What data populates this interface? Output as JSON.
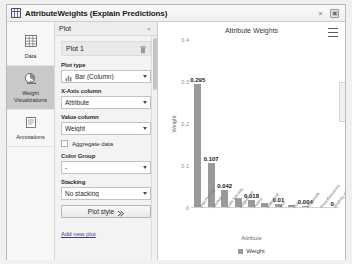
{
  "window": {
    "title": "AttributeWeights (Explain Predictions)",
    "icon": "table-chart-icon",
    "close_label": "×",
    "restore_label": "▣"
  },
  "rail": {
    "items": [
      {
        "label": "Data",
        "icon": "table-icon",
        "active": false
      },
      {
        "label": "Weight Visualizations",
        "icon": "chart-pie-icon",
        "active": true
      },
      {
        "label": "Annotations",
        "icon": "notes-icon",
        "active": false
      }
    ]
  },
  "panel": {
    "header": "Plot",
    "close_label": "×",
    "plot_card": {
      "title": "Plot 1",
      "delete_icon": "trash-icon"
    },
    "fields": [
      {
        "label": "Plot type",
        "value": "Bar (Column)",
        "icon": "bar-chart-icon"
      },
      {
        "label": "X-Axis column",
        "value": "Attribute",
        "icon": ""
      },
      {
        "label": "Value column",
        "value": "Weight",
        "icon": ""
      }
    ],
    "aggregate": {
      "label": "Aggregate data",
      "checked": false
    },
    "color_group": {
      "label": "Color Group",
      "value": "-"
    },
    "stacking": {
      "label": "Stacking",
      "value": "No stacking"
    },
    "plot_style_button": "Plot style",
    "add_new_plot": "Add new plot"
  },
  "chart_data": {
    "type": "bar",
    "title": "Attribute Weights",
    "xlabel": "Attribute",
    "ylabel": "Weight",
    "ylim": [
      0,
      0.4
    ],
    "yticks": [
      "0.4",
      "0.3",
      "0.2",
      "0.1",
      "0"
    ],
    "grid": false,
    "legend_position": "bottom",
    "series": [
      {
        "name": "Weight",
        "color": "#9a9a9a",
        "values": [
          0.295,
          0.107,
          0.042,
          0.025,
          0.018,
          0.013,
          0.01,
          0.007,
          0.004,
          0.002,
          0
        ]
      }
    ],
    "categories": [
      "Total Phenols",
      "Alcohol",
      "Color Intensity",
      "Magnesium",
      "Proline",
      "Malic Acid",
      "Ash",
      "Hue",
      "Flavanoids",
      "Proanthocyanins",
      "Alcalinity of Ash"
    ],
    "data_labels": [
      "0.295",
      "0.107",
      "0.042",
      "",
      "0.018",
      "",
      "0.01",
      "",
      "0.004",
      "",
      "0"
    ]
  }
}
